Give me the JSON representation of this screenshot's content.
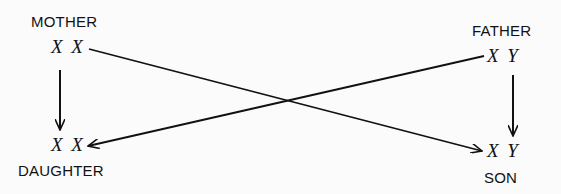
{
  "nodes": {
    "mother": {
      "label": "MOTHER",
      "chromosomes": "X X"
    },
    "father": {
      "label": "FATHER",
      "chromosomes": "X Y"
    },
    "daughter": {
      "label": "DAUGHTER",
      "chromosomes": "X X"
    },
    "son": {
      "label": "SON",
      "chromosomes": "X Y"
    }
  },
  "edges": [
    {
      "from": "mother",
      "to": "daughter"
    },
    {
      "from": "mother",
      "to": "son"
    },
    {
      "from": "father",
      "to": "daughter"
    },
    {
      "from": "father",
      "to": "son"
    }
  ],
  "colors": {
    "ink": "#111111",
    "background": "#fbfbfb"
  }
}
